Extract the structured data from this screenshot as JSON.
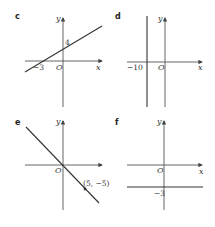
{
  "panels": {
    "c": {
      "label": "c",
      "x_axis": "x",
      "y_axis": "y",
      "origin": "O",
      "y_intercept": "4",
      "x_intercept": "−3",
      "equation_type": "line through (−3,0) and (0,4)"
    },
    "d": {
      "label": "d",
      "x_axis": "x",
      "y_axis": "y",
      "origin": "O",
      "x_intercept": "−10",
      "equation_type": "vertical line x = −10"
    },
    "e": {
      "label": "e",
      "x_axis": "x",
      "y_axis": "y",
      "origin": "O",
      "point": "(5, −5)",
      "equation_type": "line through origin and (5,−5)"
    },
    "f": {
      "label": "f",
      "x_axis": "x",
      "y_axis": "y",
      "origin": "O",
      "y_intercept": "−3",
      "equation_type": "horizontal line y = −3"
    }
  },
  "colors": {
    "axis": "#555555",
    "line": "#333333",
    "text": "#333333"
  }
}
